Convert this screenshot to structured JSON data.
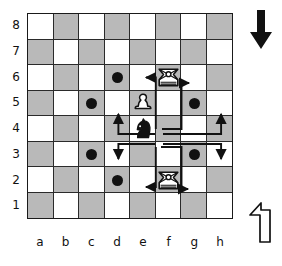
{
  "diagram": {
    "type": "chess-board-diagram",
    "board_size": 8,
    "files": [
      "a",
      "b",
      "c",
      "d",
      "e",
      "f",
      "g",
      "h"
    ],
    "ranks": [
      "8",
      "7",
      "6",
      "5",
      "4",
      "3",
      "2",
      "1"
    ],
    "colors": {
      "light_square": "#ffffff",
      "dark_square": "#b9b9b9",
      "border": "#1a1a1a",
      "marker": "#111111",
      "arrow": "#111111"
    },
    "pieces": [
      {
        "square": "f6",
        "type": "rook",
        "color": "white",
        "label": "white-rook-f6"
      },
      {
        "square": "e5",
        "type": "pawn",
        "color": "white",
        "label": "white-pawn-e5"
      },
      {
        "square": "e4",
        "type": "knight",
        "color": "black",
        "label": "black-knight-e4"
      },
      {
        "square": "f2",
        "type": "rook",
        "color": "white",
        "label": "white-rook-f2"
      }
    ],
    "markers": [
      {
        "square": "d6",
        "shape": "dot"
      },
      {
        "square": "c5",
        "shape": "dot"
      },
      {
        "square": "g5",
        "shape": "dot"
      },
      {
        "square": "c3",
        "shape": "dot"
      },
      {
        "square": "g3",
        "shape": "dot"
      },
      {
        "square": "d2",
        "shape": "dot"
      },
      {
        "square": "f6",
        "shape": "arrow-target"
      },
      {
        "square": "f2",
        "shape": "arrow-target"
      }
    ],
    "moves": [
      {
        "from": "e4",
        "to": "d6"
      },
      {
        "from": "e4",
        "to": "f6"
      },
      {
        "from": "e4",
        "to": "c5"
      },
      {
        "from": "e4",
        "to": "g5"
      },
      {
        "from": "e4",
        "to": "c3"
      },
      {
        "from": "e4",
        "to": "g3"
      },
      {
        "from": "e4",
        "to": "d2"
      },
      {
        "from": "e4",
        "to": "f2"
      }
    ],
    "side_glyphs": [
      {
        "name": "down-arrow",
        "direction": "down",
        "style": "solid"
      },
      {
        "name": "up-left-arrow",
        "direction": "up-left",
        "style": "outline"
      }
    ]
  }
}
